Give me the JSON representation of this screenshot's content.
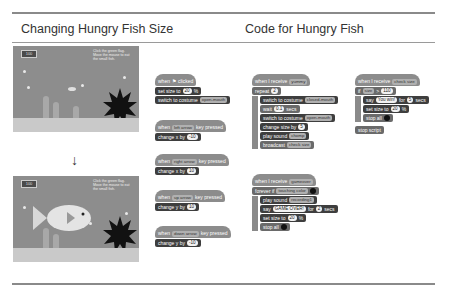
{
  "headings": {
    "left": "Changing Hungry Fish Size",
    "right": "Code for Hungry Fish"
  },
  "stage": {
    "counter_top": "100",
    "counter_bottom": "100",
    "instructions": "Click the green flag. Move the mouse to eat the small fish.",
    "arrow": "↓"
  },
  "scripts": {
    "flag_script": {
      "hat": "when",
      "hat_suffix": "clicked",
      "set_size_label": "set size to",
      "set_size_value": "20",
      "set_size_unit": "%",
      "switch_label": "switch to costume",
      "switch_value": "open-mouth"
    },
    "left_key": {
      "when": "when",
      "key": "left arrow",
      "pressed": "key pressed",
      "change": "change x by",
      "value": "-10"
    },
    "right_key": {
      "when": "when",
      "key": "right arrow",
      "pressed": "key pressed",
      "change": "change x by",
      "value": "10"
    },
    "up_key": {
      "when": "when",
      "key": "up arrow",
      "pressed": "key pressed",
      "change": "change y by",
      "value": "10"
    },
    "down_key": {
      "when": "when",
      "key": "down arrow",
      "pressed": "key pressed",
      "change": "change y by",
      "value": "-10"
    },
    "receive_yummy": {
      "hat": "when I receive",
      "message": "yummy",
      "repeat": "repeat",
      "repeat_value": "2",
      "switch1": "switch to costume",
      "costume1": "closed-mouth",
      "wait": "wait",
      "wait_value": "0.1",
      "wait_unit": "secs",
      "switch2": "switch to costume",
      "costume2": "open-mouth",
      "change_size": "change size by",
      "change_size_value": "5",
      "play_sound": "play sound",
      "sound": "chomp",
      "broadcast": "broadcast",
      "broadcast_value": "check size"
    },
    "receive_gameover": {
      "hat": "when I receive",
      "message": "gameover",
      "forever_if": "forever if",
      "touching": "touching color",
      "play_sound": "play sound",
      "sound": "recording1",
      "say": "say",
      "say_value": "GAME OVER!",
      "say_for": "for",
      "say_secs": "2",
      "secs": "secs",
      "set_size": "set size to",
      "set_size_value": "20",
      "unit": "%",
      "stop": "stop all"
    },
    "check_size": {
      "hat": "when I receive",
      "message": "check size",
      "if": "if",
      "size": "size",
      "gt": ">",
      "threshold": "110",
      "say": "say",
      "say_value": "You win!",
      "say_for": "for",
      "say_secs": "5",
      "secs": "secs",
      "set_size": "set size to",
      "set_size_value": "20",
      "unit": "%",
      "stop_all": "stop all",
      "stop_script": "stop script"
    }
  }
}
